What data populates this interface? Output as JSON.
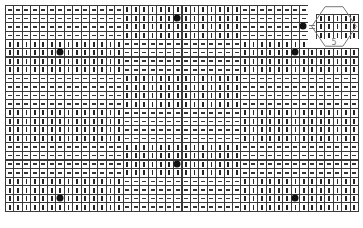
{
  "board": {
    "cols": 42,
    "rows": 24,
    "section_cols": 14,
    "band_rows": 4,
    "pattern_note": "checkerboard of 14-col x 4-row blocks; block (band+section) even = dash, odd = vertical",
    "first_block_mark": "dash",
    "colors": {
      "grid": "#3a3a3a",
      "mark": "#222222",
      "dot": "#111111",
      "hex": "#777777"
    },
    "dots": [
      {
        "row": 1,
        "col": 20
      },
      {
        "row": 2,
        "col": 35
      },
      {
        "row": 5,
        "col": 6
      },
      {
        "row": 5,
        "col": 34
      },
      {
        "row": 18,
        "col": 20
      },
      {
        "row": 22,
        "col": 6
      },
      {
        "row": 22,
        "col": 34
      }
    ],
    "blank_cells": [
      [
        0,
        36
      ],
      [
        1,
        36
      ],
      [
        2,
        36
      ],
      [
        3,
        36
      ],
      [
        4,
        36
      ],
      [
        0,
        37
      ],
      [
        0,
        38
      ],
      [
        0,
        39
      ],
      [
        0,
        40
      ],
      [
        0,
        41
      ],
      [
        4,
        37
      ],
      [
        4,
        38
      ],
      [
        4,
        39
      ],
      [
        4,
        40
      ],
      [
        4,
        41
      ]
    ],
    "overrides": [
      {
        "row": 1,
        "col": 37,
        "mark": "vertical"
      },
      {
        "row": 1,
        "col": 38,
        "mark": "vertical"
      },
      {
        "row": 1,
        "col": 39,
        "mark": "vertical"
      },
      {
        "row": 1,
        "col": 40,
        "mark": "vertical"
      },
      {
        "row": 1,
        "col": 41,
        "mark": "vertical"
      },
      {
        "row": 2,
        "col": 37,
        "mark": "vertical"
      },
      {
        "row": 2,
        "col": 38,
        "mark": "vertical"
      },
      {
        "row": 2,
        "col": 39,
        "mark": "vertical"
      },
      {
        "row": 2,
        "col": 40,
        "mark": "vertical"
      },
      {
        "row": 2,
        "col": 41,
        "mark": "vertical"
      },
      {
        "row": 3,
        "col": 37,
        "mark": "vertical"
      },
      {
        "row": 3,
        "col": 38,
        "mark": "vertical"
      },
      {
        "row": 3,
        "col": 39,
        "mark": "vertical"
      },
      {
        "row": 3,
        "col": 40,
        "mark": "vertical"
      },
      {
        "row": 3,
        "col": 41,
        "mark": "vertical"
      },
      {
        "row": 4,
        "col": 35,
        "mark": "vertical"
      },
      {
        "row": 2,
        "col": 36,
        "mark": "equals"
      }
    ],
    "hexagon": {
      "col_start": 36.5,
      "col_end": 41.8,
      "row_start": 0.2,
      "row_end": 4.8,
      "label": "5"
    }
  }
}
